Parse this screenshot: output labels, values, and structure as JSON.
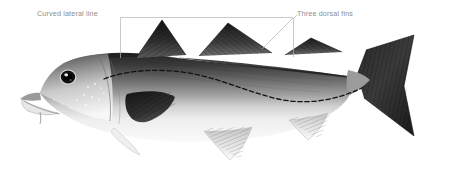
{
  "figure": {
    "width": 449,
    "height": 172,
    "background_color": "#ffffff",
    "species_depicted": "pollock-cod-like-fish",
    "orientation": "left-facing-lateral-view"
  },
  "annotations": [
    {
      "id": "curved-lateral-line",
      "label": "Curved lateral line",
      "text_color": "#8c8c8c",
      "leader_color": "#b3b3b3",
      "label_x": 37,
      "label_y": 10
    },
    {
      "id": "three-dorsal-fins",
      "label": "Three dorsal fins",
      "text_color": "#8c8c8c",
      "leader_color": "#b3b3b3",
      "label_x": 297,
      "label_y": 10
    }
  ],
  "colors": {
    "background": "#ffffff",
    "label_text": "#8c8c8c",
    "leader_line": "#b3b3b3",
    "body_dark": "#2b2b2b",
    "body_mid": "#777777",
    "body_light": "#f2f2f2",
    "fin_dark": "#1f1f1f",
    "eye": "#111111"
  },
  "parts": {
    "head": "head",
    "eye": "eye",
    "mouth": "mouth",
    "barbel": "chin-barbel",
    "pectoral_fin": "pectoral-fin",
    "pelvic_fin": "pelvic-fin",
    "dorsal_fin_1": "first-dorsal-fin",
    "dorsal_fin_2": "second-dorsal-fin",
    "dorsal_fin_3": "third-dorsal-fin",
    "anal_fin_1": "first-anal-fin",
    "anal_fin_2": "second-anal-fin",
    "caudal_fin": "caudal-fin",
    "lateral_line": "lateral-line"
  }
}
